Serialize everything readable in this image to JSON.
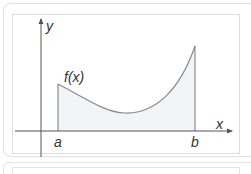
{
  "diagram": {
    "labels": {
      "y_axis": "y",
      "x_axis": "x",
      "function": "f(x)",
      "lower_bound": "a",
      "upper_bound": "b"
    },
    "colors": {
      "axis": "#555555",
      "curve": "#8a8a8a",
      "fill": "#f3f4f6",
      "label": "#333333",
      "frame_border": "#dedede"
    }
  }
}
